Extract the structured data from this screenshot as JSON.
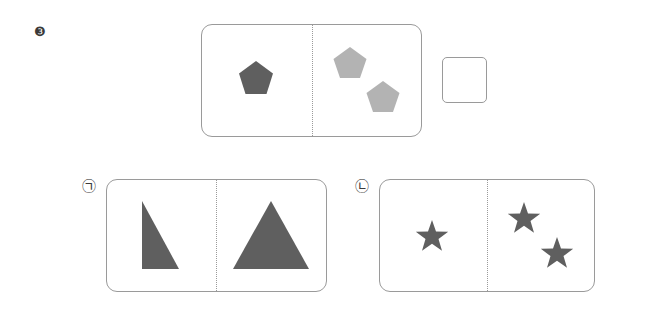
{
  "problem": {
    "number_label": "❸",
    "colors": {
      "dark": "#5f5f5f",
      "light": "#b3b3b3",
      "border": "#9a9a9a"
    },
    "question_card": {
      "left_panel": [
        {
          "shape": "pentagon",
          "shade": "dark",
          "count": 1
        }
      ],
      "right_panel": [
        {
          "shape": "pentagon",
          "shade": "light",
          "count": 2
        }
      ]
    },
    "answer_box": {
      "value": ""
    }
  },
  "options": [
    {
      "label": "㉠",
      "left_panel": [
        {
          "shape": "right-triangle",
          "shade": "dark"
        }
      ],
      "right_panel": [
        {
          "shape": "isosceles-triangle",
          "shade": "dark"
        }
      ]
    },
    {
      "label": "㉡",
      "left_panel": [
        {
          "shape": "star",
          "shade": "dark",
          "count": 1
        }
      ],
      "right_panel": [
        {
          "shape": "star",
          "shade": "dark",
          "count": 2
        }
      ]
    }
  ]
}
